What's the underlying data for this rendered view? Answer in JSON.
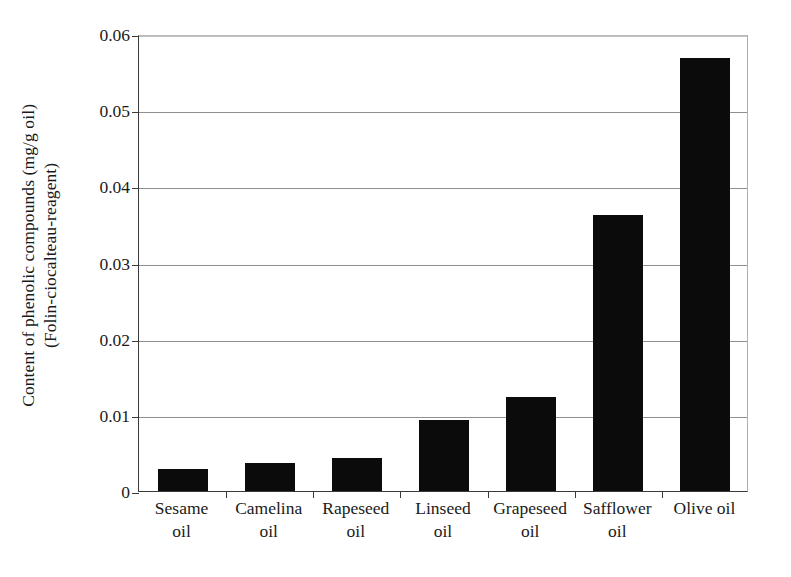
{
  "chart_data": {
    "type": "bar",
    "title": "",
    "subtitle": "",
    "xlabel": "",
    "ylabel": "Content of phenolic compounds (mg/g oil)",
    "ylabel_line2": "(Folin-ciocalteau-reagent)",
    "categories": [
      "Sesame oil",
      "Camelina oil",
      "Rapeseed oil",
      "Linseed oil",
      "Grapeseed oil",
      "Safflower oil",
      "Olive oil"
    ],
    "category_lines": [
      [
        "Sesame",
        "oil"
      ],
      [
        "Camelina",
        "oil"
      ],
      [
        "Rapeseed",
        "oil"
      ],
      [
        "Linseed",
        "oil"
      ],
      [
        "Grapeseed",
        "oil"
      ],
      [
        "Safflower",
        "oil"
      ],
      [
        "Olive oil"
      ]
    ],
    "values": [
      0.0029,
      0.0037,
      0.0044,
      0.0093,
      0.0124,
      0.0363,
      0.0569
    ],
    "ylim": [
      0,
      0.06
    ],
    "yticks": [
      0,
      0.01,
      0.02,
      0.03,
      0.04,
      0.05,
      0.06
    ],
    "ytick_labels": [
      "0",
      "0.01",
      "0.02",
      "0.03",
      "0.04",
      "0.05",
      "0.06"
    ],
    "grid": true,
    "grid_axis": "y",
    "legend": false,
    "legend_position": "none",
    "bar_color": "#0b0b0b",
    "grid_color": "#8f8f8f",
    "axis_color": "#3a3a3a",
    "background_color": "#ffffff"
  }
}
